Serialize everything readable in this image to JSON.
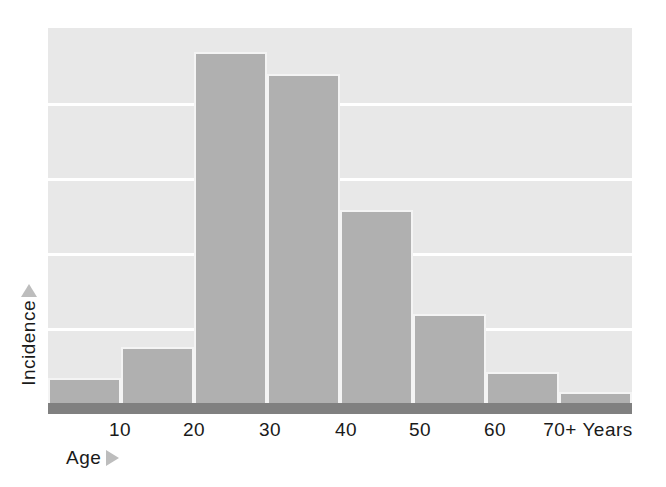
{
  "chart_data": {
    "type": "bar",
    "title": "",
    "subtitle": "",
    "xlabel": "Age",
    "ylabel": "Incidence",
    "x_unit_label": "Years",
    "categories": [
      "0-10",
      "10-20",
      "20-30",
      "30-40",
      "40-50",
      "50-60",
      "60-70",
      "70+"
    ],
    "tick_labels": [
      "10",
      "20",
      "30",
      "40",
      "50",
      "60",
      "70+ Years"
    ],
    "tick_values": [
      10,
      20,
      30,
      40,
      50,
      60,
      70
    ],
    "values": [
      6.7,
      15.0,
      93.5,
      87.8,
      51.5,
      23.8,
      8.3,
      2.9
    ],
    "ylim": [
      0,
      100
    ],
    "xlim": [
      0,
      80
    ],
    "grid": true,
    "gridline_values": [
      20,
      40,
      60,
      80
    ],
    "legend": "none",
    "legend_position": "none",
    "bar_color": "#b0b0b0",
    "plot_background_color": "#e8e8e8",
    "gridline_color": "#ffffff",
    "axis_bar_color": "#808080",
    "arrow_color": "#bdbdbd",
    "text_color": "#1a1a1a",
    "annotations": []
  },
  "axis": {
    "x_arrow_icon": "triangle-right-icon",
    "y_arrow_icon": "triangle-up-icon"
  }
}
